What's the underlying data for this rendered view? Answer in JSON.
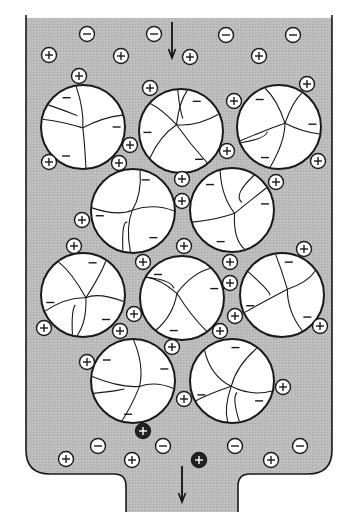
{
  "diagram": {
    "colors": {
      "solution": "#b9b9b9",
      "bead": "#ffffff",
      "outline": "#1a1a1a",
      "ion_fill": "#ffffff",
      "dark_ion_fill": "#222222"
    },
    "flow_arrows": [
      {
        "label": "inflow",
        "x": 172,
        "y1": 22,
        "y2": 58
      },
      {
        "label": "outflow",
        "x": 182,
        "y1": 466,
        "y2": 502
      }
    ],
    "beads": [
      {
        "cx": 83,
        "cy": 127,
        "r": 42
      },
      {
        "cx": 181,
        "cy": 131,
        "r": 42
      },
      {
        "cx": 279,
        "cy": 127,
        "r": 42
      },
      {
        "cx": 133,
        "cy": 211,
        "r": 42
      },
      {
        "cx": 232,
        "cy": 210,
        "r": 42
      },
      {
        "cx": 83,
        "cy": 295,
        "r": 42
      },
      {
        "cx": 182,
        "cy": 298,
        "r": 42
      },
      {
        "cx": 282,
        "cy": 295,
        "r": 42
      },
      {
        "cx": 133,
        "cy": 381,
        "r": 42
      },
      {
        "cx": 232,
        "cy": 381,
        "r": 42
      }
    ],
    "free_anions": [
      {
        "x": 87,
        "y": 34
      },
      {
        "x": 154,
        "y": 34
      },
      {
        "x": 226,
        "y": 35
      },
      {
        "x": 293,
        "y": 35
      },
      {
        "x": 98,
        "y": 446
      },
      {
        "x": 163,
        "y": 446
      },
      {
        "x": 235,
        "y": 446
      },
      {
        "x": 300,
        "y": 446
      }
    ],
    "free_cations": [
      {
        "x": 49,
        "y": 55
      },
      {
        "x": 121,
        "y": 56
      },
      {
        "x": 190,
        "y": 57
      },
      {
        "x": 259,
        "y": 56
      },
      {
        "x": 66,
        "y": 459
      },
      {
        "x": 132,
        "y": 460
      },
      {
        "x": 271,
        "y": 460
      }
    ],
    "bound_cations": [
      {
        "x": 79,
        "y": 76
      },
      {
        "x": 150,
        "y": 88
      },
      {
        "x": 307,
        "y": 84
      },
      {
        "x": 234,
        "y": 101
      },
      {
        "x": 130,
        "y": 145
      },
      {
        "x": 49,
        "y": 162
      },
      {
        "x": 119,
        "y": 163
      },
      {
        "x": 227,
        "y": 151
      },
      {
        "x": 318,
        "y": 161
      },
      {
        "x": 182,
        "y": 179
      },
      {
        "x": 276,
        "y": 182
      },
      {
        "x": 182,
        "y": 201
      },
      {
        "x": 82,
        "y": 220
      },
      {
        "x": 74,
        "y": 246
      },
      {
        "x": 184,
        "y": 246
      },
      {
        "x": 143,
        "y": 262
      },
      {
        "x": 230,
        "y": 262
      },
      {
        "x": 304,
        "y": 249
      },
      {
        "x": 230,
        "y": 283
      },
      {
        "x": 134,
        "y": 314
      },
      {
        "x": 235,
        "y": 316
      },
      {
        "x": 44,
        "y": 328
      },
      {
        "x": 120,
        "y": 331
      },
      {
        "x": 220,
        "y": 331
      },
      {
        "x": 320,
        "y": 326
      },
      {
        "x": 172,
        "y": 347
      },
      {
        "x": 87,
        "y": 362
      },
      {
        "x": 283,
        "y": 387
      },
      {
        "x": 184,
        "y": 399
      }
    ],
    "dark_cations": [
      {
        "x": 143,
        "y": 431
      },
      {
        "x": 199,
        "y": 460
      }
    ]
  }
}
